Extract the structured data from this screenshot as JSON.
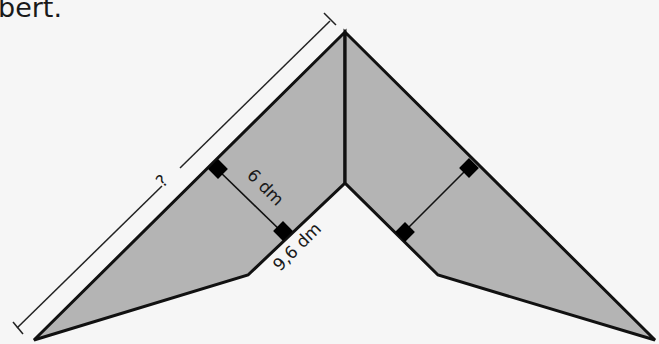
{
  "caption": {
    "text": "bert."
  },
  "figure": {
    "fill_color": "#b4b4b4",
    "stroke_color": "#111111",
    "background": "#f6f6f6",
    "labels": {
      "unknown_side": "?",
      "height": "6 dm",
      "inner_side": "9,6 dm"
    }
  }
}
